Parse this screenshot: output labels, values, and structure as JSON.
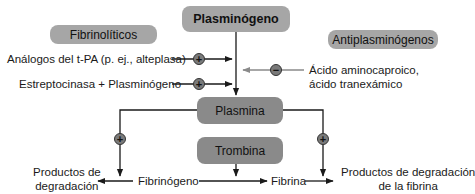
{
  "nodes": {
    "plasminogen": "Plasminógeno",
    "fibrinolytics": "Fibrinolíticos",
    "antiplasminogens": "Antiplasminógenos",
    "plasmin": "Plasmina",
    "thrombin": "Trombina"
  },
  "labels": {
    "tpa_analogs": "Análogos del t-PA (p. ej., alteplasa)",
    "streptokinase": "Estreptocinasa + Plasminógeno",
    "aminocaproic_line1": "Ácido aminocaproico,",
    "aminocaproic_line2": "ácido tranexámico",
    "degradation_left_line1": "Productos de",
    "degradation_left_line2": "degradación",
    "fibrinogen": "Fibrinógeno",
    "fibrin": "Fibrina",
    "fdp_line1": "Productos de degradación",
    "fdp_line2": "de la fibrina"
  },
  "signs": {
    "plus": "+",
    "minus": "−"
  },
  "colors": {
    "box_light": "#a6a6a6",
    "box_dark": "#8a8a8a",
    "line": "#1a1a1a",
    "line_inhibit": "#8a8a8a"
  }
}
